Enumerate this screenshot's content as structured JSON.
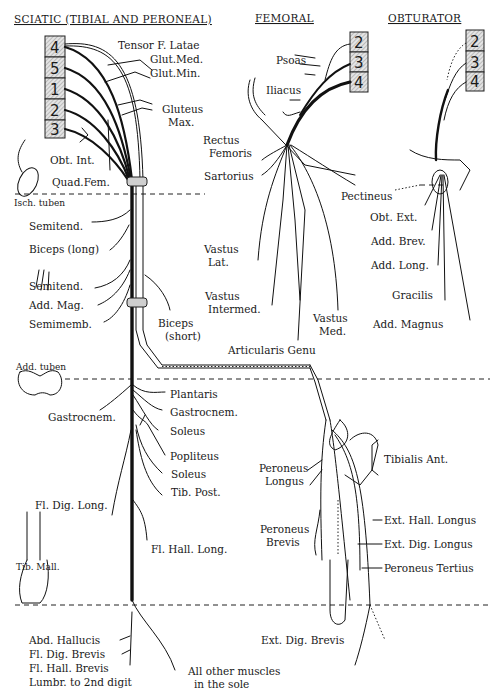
{
  "titles": {
    "sciatic": "SCIATIC (TIBIAL AND PERONEAL)",
    "femoral": "FEMORAL",
    "obturator": "OBTURATOR"
  },
  "roots": {
    "sciatic": [
      "4",
      "5",
      "1",
      "2",
      "3"
    ],
    "femoral": [
      "2",
      "3",
      "4"
    ],
    "obturator": [
      "2",
      "3",
      "4"
    ]
  },
  "landmarks": {
    "isch_tuber": "Isch. tuben",
    "add_tuber": "Add. tuben",
    "tib_mall": "Tib. Mall."
  },
  "sciatic_muscles": {
    "hip": [
      "Tensor F. Latae",
      "Glut.Med.",
      "Glut.Min.",
      "Gluteus",
      "Max.",
      "Obt. Int.",
      "Quad.Fem."
    ],
    "thigh": [
      "Semitend.",
      "Biceps (long)",
      "Semitend.",
      "Add. Mag.",
      "Semimemb.",
      "Biceps",
      "(short)"
    ],
    "leg_tibial": [
      "Gastrocnem.",
      "Plantaris",
      "Gastrocnem.",
      "Soleus",
      "Popliteus",
      "Soleus",
      "Tib. Post.",
      "Fl. Dig. Long.",
      "Fl. Hall. Long."
    ],
    "foot": [
      "Abd. Hallucis",
      "Fl. Dig. Brevis",
      "Fl. Hall. Brevis",
      "Lumbr. to 2nd digit",
      "All other muscles",
      "in the sole"
    ]
  },
  "femoral_muscles": [
    "Psoas",
    "Iliacus",
    "Rectus",
    "Femoris",
    "Sartorius",
    "Vastus",
    "Lat.",
    "Vastus",
    "Intermed.",
    "Vastus",
    "Med.",
    "Articularis Genu"
  ],
  "obturator_muscles": [
    "Pectineus",
    "Obt. Ext.",
    "Add. Brev.",
    "Add. Long.",
    "Gracilis",
    "Add. Magnus"
  ],
  "peroneal_muscles": [
    "Tibialis Ant.",
    "Peroneus",
    "Longus",
    "Peroneus",
    "Brevis",
    "Ext. Hall. Longus",
    "Ext. Dig. Longus",
    "Peroneus Tertius",
    "Ext. Dig. Brevis"
  ]
}
